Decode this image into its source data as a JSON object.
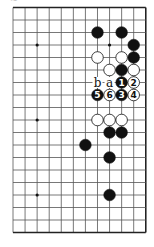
{
  "diagram": {
    "type": "go-board-fragment",
    "caption_fragment": "≈",
    "grid": {
      "columns": 12,
      "rows": 19,
      "origin_x": 13,
      "origin_y": 7.5,
      "spacing_x": 12.07,
      "spacing_y": 12.5,
      "edges": {
        "top": true,
        "right": true,
        "bottom": true,
        "left": false
      }
    },
    "colors": {
      "line": "#555555",
      "edge": "#222222",
      "black_stone": "#111111",
      "white_stone": "#ffffff",
      "star": "#111111"
    },
    "star_points": [
      {
        "col": 2,
        "row": 3
      },
      {
        "col": 8,
        "row": 3
      },
      {
        "col": 2,
        "row": 9
      },
      {
        "col": 2,
        "row": 15
      }
    ],
    "stones": [
      {
        "col": 7,
        "row": 2,
        "color": "black"
      },
      {
        "col": 9,
        "row": 2,
        "color": "black"
      },
      {
        "col": 10,
        "row": 3,
        "color": "black"
      },
      {
        "col": 10,
        "row": 4,
        "color": "black"
      },
      {
        "col": 7,
        "row": 4,
        "color": "white"
      },
      {
        "col": 9,
        "row": 4,
        "color": "white"
      },
      {
        "col": 8,
        "row": 5,
        "color": "white"
      },
      {
        "col": 9,
        "row": 5,
        "color": "black"
      },
      {
        "col": 10,
        "row": 5,
        "color": "white"
      },
      {
        "col": 9,
        "row": 6,
        "color": "black",
        "label": "1"
      },
      {
        "col": 10,
        "row": 6,
        "color": "white",
        "label": "2"
      },
      {
        "col": 9,
        "row": 7,
        "color": "black",
        "label": "3"
      },
      {
        "col": 10,
        "row": 7,
        "color": "white",
        "label": "4"
      },
      {
        "col": 7,
        "row": 7,
        "color": "black",
        "label": "5"
      },
      {
        "col": 8,
        "row": 7,
        "color": "white",
        "label": "6"
      },
      {
        "col": 7,
        "row": 9,
        "color": "white"
      },
      {
        "col": 8,
        "row": 9,
        "color": "white"
      },
      {
        "col": 9,
        "row": 9,
        "color": "white"
      },
      {
        "col": 8,
        "row": 10,
        "color": "black"
      },
      {
        "col": 9,
        "row": 10,
        "color": "black"
      },
      {
        "col": 6,
        "row": 11,
        "color": "black"
      },
      {
        "col": 8,
        "row": 12,
        "color": "black"
      },
      {
        "col": 8,
        "row": 15,
        "color": "black"
      }
    ],
    "point_labels": [
      {
        "col": 7,
        "row": 6,
        "text": "b"
      },
      {
        "col": 8,
        "row": 6,
        "text": "a"
      }
    ]
  }
}
